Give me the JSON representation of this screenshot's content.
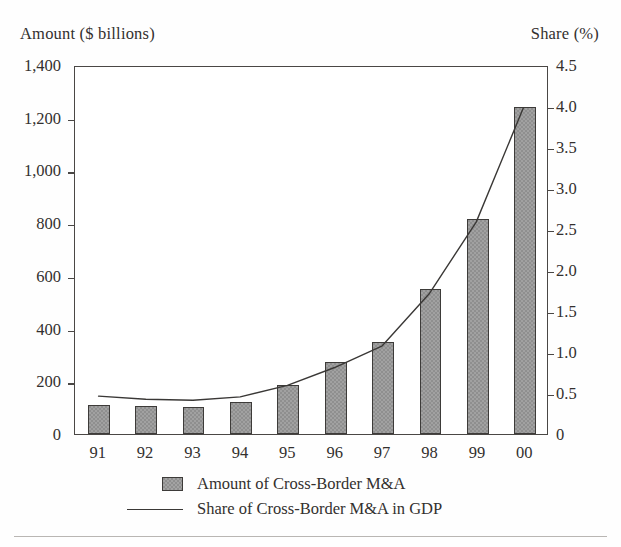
{
  "axes": {
    "left_caption": "Amount ($ billions)",
    "right_caption": "Share (%)",
    "left_ticks": [
      "1,400",
      "1,200",
      "1,000",
      "800",
      "600",
      "400",
      "200",
      "0"
    ],
    "right_ticks": [
      "4.5",
      "4.0",
      "3.5",
      "3.0",
      "2.5",
      "2.0",
      "1.5",
      "1.0",
      "0.5",
      "0"
    ]
  },
  "legend": {
    "bar_label": "Amount of Cross-Border M&A",
    "line_label": "Share of Cross-Border M&A in GDP"
  },
  "colors": {
    "bar_fill": "#8f8f8f",
    "bar_stroke": "#3d3b39",
    "line": "#3a3836",
    "axis": "#4a4745",
    "text": "#33302e"
  },
  "chart_data": {
    "type": "bar",
    "title": "",
    "xlabel": "",
    "ylabel": "Amount ($ billions)",
    "y2label": "Share (%)",
    "grid": false,
    "legend_position": "bottom",
    "categories": [
      "91",
      "92",
      "93",
      "94",
      "95",
      "96",
      "97",
      "98",
      "99",
      "00"
    ],
    "ylim": [
      0,
      1400
    ],
    "ytick_values": [
      0,
      200,
      400,
      600,
      800,
      1000,
      1200,
      1400
    ],
    "y2lim": [
      0,
      4.5
    ],
    "y2tick_values": [
      0,
      0.5,
      1.0,
      1.5,
      2.0,
      2.5,
      3.0,
      3.5,
      4.0,
      4.5
    ],
    "series": [
      {
        "name": "Amount of Cross-Border M&A",
        "type": "bar",
        "axis": "left",
        "unit": "$ billions",
        "values": [
          110,
          105,
          103,
          122,
          185,
          275,
          350,
          550,
          815,
          1240
        ]
      },
      {
        "name": "Share of Cross-Border M&A in GDP",
        "type": "line",
        "axis": "right",
        "unit": "%",
        "values": [
          0.47,
          0.43,
          0.42,
          0.46,
          0.6,
          0.82,
          1.08,
          1.72,
          2.6,
          4.0
        ]
      }
    ]
  }
}
